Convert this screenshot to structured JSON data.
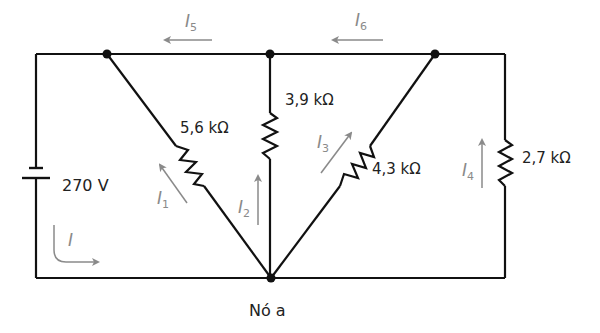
{
  "diagram": {
    "type": "electrical-circuit",
    "colors": {
      "wire": "#111111",
      "current_arrow": "#8a8a8a",
      "text": "#222222"
    },
    "source": {
      "label": "270 V",
      "symbol": "battery"
    },
    "resistors": [
      {
        "id": "R1",
        "label": "5,6 kΩ"
      },
      {
        "id": "R2",
        "label": "3,9 kΩ"
      },
      {
        "id": "R3",
        "label": "4,3 kΩ"
      },
      {
        "id": "R4",
        "label": "2,7 kΩ"
      }
    ],
    "currents": [
      {
        "id": "I",
        "sym": "I",
        "sub": ""
      },
      {
        "id": "I1",
        "sym": "I",
        "sub": "1"
      },
      {
        "id": "I2",
        "sym": "I",
        "sub": "2"
      },
      {
        "id": "I3",
        "sym": "I",
        "sub": "3"
      },
      {
        "id": "I4",
        "sym": "I",
        "sub": "4"
      },
      {
        "id": "I5",
        "sym": "I",
        "sub": "5"
      },
      {
        "id": "I6",
        "sym": "I",
        "sub": "6"
      }
    ],
    "node_label": "Nó a"
  }
}
